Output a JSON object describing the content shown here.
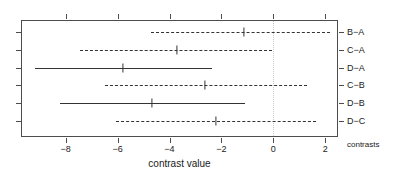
{
  "chart_data": {
    "type": "line",
    "title": "",
    "subtitle": "",
    "xlabel": "contrast value",
    "ylabel": "contrasts",
    "xlim": [
      -9.71,
      2.5
    ],
    "xticks": [
      -8,
      -6,
      -4,
      -2,
      0,
      2
    ],
    "xtick_labels": [
      "−8",
      "−6",
      "−4",
      "−2",
      "0",
      "2"
    ],
    "categories": [
      "B−A",
      "C−A",
      "D−A",
      "C−B",
      "D−B",
      "D−C"
    ],
    "grid": false,
    "legend": "none",
    "reference_line": {
      "value": 0,
      "style": "dotted",
      "color": "#c8c8c8"
    },
    "series": [
      {
        "name": "contrast interval",
        "points": [
          {
            "label": "B−A",
            "estimate": -1.13,
            "lower": -4.71,
            "upper": 2.19,
            "style": "dashed",
            "significant": false
          },
          {
            "label": "C−A",
            "estimate": -3.71,
            "lower": -7.45,
            "upper": -0.05,
            "style": "dashed",
            "significant": false
          },
          {
            "label": "D−A",
            "estimate": -5.79,
            "lower": -9.18,
            "upper": -2.36,
            "style": "solid",
            "significant": true
          },
          {
            "label": "C−B",
            "estimate": -2.63,
            "lower": -6.49,
            "upper": 1.3,
            "style": "dashed",
            "significant": false
          },
          {
            "label": "D−B",
            "estimate": -4.67,
            "lower": -8.22,
            "upper": -1.09,
            "style": "solid",
            "significant": true
          },
          {
            "label": "D−C",
            "estimate": -2.21,
            "lower": -6.06,
            "upper": 1.64,
            "style": "dashed",
            "significant": false
          }
        ]
      }
    ]
  },
  "colors": {
    "line": "#333333",
    "axis": "#4d4d4d",
    "text": "#1a1a1a",
    "reference": "#c8c8c8",
    "background": "#ffffff"
  }
}
